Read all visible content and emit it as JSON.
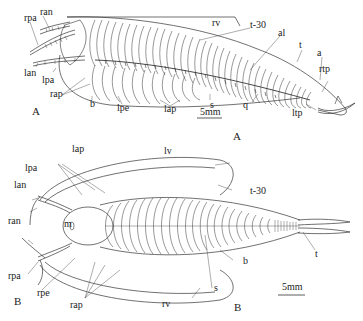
{
  "figure": {
    "panels": [
      {
        "id": "A",
        "panel_label": "A",
        "caption_label": "A",
        "scale_bar": "5mm",
        "labels": {
          "ran": "ran",
          "rpa": "rpa",
          "lan": "lan",
          "lpa": "lpa",
          "rap": "rap",
          "b": "b",
          "lpe": "lpe",
          "lap": "lap",
          "s": "s",
          "q": "q",
          "rv": "rv",
          "t30": "t-30",
          "al": "al",
          "t": "t",
          "a": "a",
          "rtp": "rtp",
          "ltp": "ltp"
        }
      },
      {
        "id": "B",
        "panel_label": "B",
        "caption_label": "B",
        "scale_bar": "5mm",
        "labels": {
          "lap": "lap",
          "lv": "lv",
          "lpa": "lpa",
          "lan": "lan",
          "m": "m",
          "ran": "ran",
          "rpa": "rpa",
          "rpe": "rpe",
          "rap": "rap",
          "rv": "rv",
          "s": "s",
          "b": "b",
          "t30": "t-30",
          "t": "t"
        }
      }
    ],
    "line_color": "#333333",
    "background": "#ffffff"
  }
}
